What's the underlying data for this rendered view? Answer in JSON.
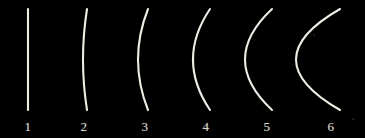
{
  "plate": {
    "title": "Series of arcs of increasing curvature",
    "background_color": "#000000",
    "stroke_color": "#efece4",
    "label_color": "#d8d5ce",
    "width": 365,
    "height": 138,
    "count": 6
  },
  "chart_data": {
    "type": "line",
    "xlabel": "",
    "ylabel": "",
    "grid": false,
    "legend": "none",
    "chord_top_y": 9,
    "chord_bottom_y": 110,
    "series": [
      {
        "name": "1",
        "label": "1",
        "chord_x": 28,
        "sagitta": 0,
        "curvature_rank": 1,
        "shape": "straight line"
      },
      {
        "name": "2",
        "label": "2",
        "chord_x": 87,
        "sagitta": 4,
        "curvature_rank": 2,
        "shape": "very shallow arc"
      },
      {
        "name": "3",
        "label": "3",
        "chord_x": 148,
        "sagitta": 10,
        "curvature_rank": 3,
        "shape": "shallow arc"
      },
      {
        "name": "4",
        "label": "4",
        "chord_x": 210,
        "sagitta": 17,
        "curvature_rank": 4,
        "shape": "moderate arc"
      },
      {
        "name": "5",
        "label": "5",
        "chord_x": 272,
        "sagitta": 27,
        "curvature_rank": 5,
        "shape": "deep arc"
      },
      {
        "name": "6",
        "label": "6",
        "chord_x": 340,
        "sagitta": 44,
        "curvature_rank": 6,
        "shape": "near semicircle, ends clipped at right edge"
      }
    ],
    "categories": [
      "1",
      "2",
      "3",
      "4",
      "5",
      "6"
    ],
    "values": [
      0,
      4,
      10,
      17,
      27,
      44
    ]
  },
  "labels": [
    {
      "text": "1",
      "x": 28,
      "y": 126
    },
    {
      "text": "2",
      "x": 84,
      "y": 126
    },
    {
      "text": "3",
      "x": 145,
      "y": 126
    },
    {
      "text": "4",
      "x": 206,
      "y": 126
    },
    {
      "text": "5",
      "x": 267,
      "y": 126
    },
    {
      "text": "6",
      "x": 331,
      "y": 126
    }
  ]
}
